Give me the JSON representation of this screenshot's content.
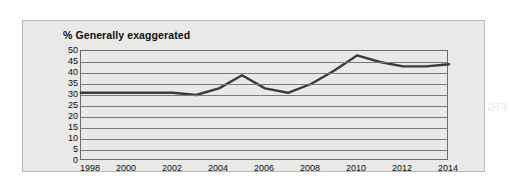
{
  "chart_data": {
    "type": "line",
    "title": "% Generally exaggerated",
    "xlabel": "",
    "ylabel": "",
    "xlim": [
      1998,
      2014
    ],
    "ylim": [
      0,
      50
    ],
    "ytick_step": 5,
    "yticks": [
      50,
      45,
      40,
      35,
      30,
      25,
      20,
      15,
      10,
      5,
      0
    ],
    "xticks": [
      1998,
      2000,
      2002,
      2004,
      2006,
      2008,
      2010,
      2012,
      2014
    ],
    "grid": true,
    "legend": "none",
    "series": [
      {
        "name": "% Generally exaggerated",
        "color": "#3b3b3b",
        "x": [
          1998,
          1999,
          2000,
          2001,
          2002,
          2003,
          2004,
          2005,
          2006,
          2007,
          2008,
          2009,
          2010,
          2011,
          2012,
          2013,
          2014
        ],
        "values": [
          31,
          31,
          31,
          31,
          31,
          30,
          33,
          39,
          33,
          31,
          35,
          41,
          48,
          45,
          43,
          43,
          44
        ]
      }
    ]
  },
  "panel": {
    "bleed_text": "FIGURE"
  },
  "colors": {
    "line": "#3b3b3b",
    "grid": "#7a7a7a",
    "panel_background": "#e9e9e7",
    "panel_border": "#b9b9b5",
    "text": "#0e0e0e"
  }
}
